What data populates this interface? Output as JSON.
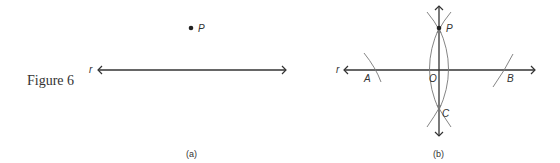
{
  "figure": {
    "caption": "Figure 6"
  },
  "panel_a": {
    "sublabel": "(a)",
    "point_label": "P",
    "line_label": "r"
  },
  "panel_b": {
    "sublabel": "(b)",
    "line_label": "r",
    "labels": {
      "P": "P",
      "A": "A",
      "O": "O",
      "B": "B",
      "C": "C"
    }
  },
  "colors": {
    "stroke": "#333333",
    "arc": "#777777"
  }
}
